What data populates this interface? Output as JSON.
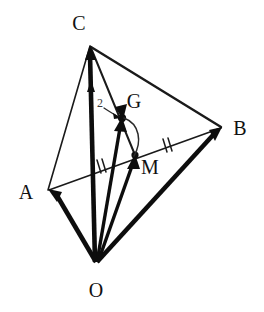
{
  "figure": {
    "background_color": "#ffffff",
    "ink_color": "#0d0d0d",
    "width": 264,
    "height": 312
  },
  "labels": {
    "vertex_a": "A",
    "vertex_b": "B",
    "vertex_c": "C",
    "vertex_o": "O",
    "point_g": "G",
    "point_m": "M",
    "ratio_two": "2"
  },
  "points": {
    "A": {
      "name": "A",
      "x": 48,
      "y": 190,
      "label_x": 26,
      "label_y": 199
    },
    "B": {
      "name": "B",
      "x": 222,
      "y": 128,
      "label_x": 236,
      "label_y": 135
    },
    "C": {
      "name": "C",
      "x": 90,
      "y": 45,
      "label_x": 79,
      "label_y": 29
    },
    "O": {
      "name": "O",
      "x": 96,
      "y": 264,
      "label_x": 88,
      "label_y": 297
    },
    "G": {
      "name": "G",
      "x": 122,
      "y": 118,
      "label_x": 127,
      "label_y": 107
    },
    "M": {
      "name": "M",
      "x": 135,
      "y": 155,
      "label_x": 142,
      "label_y": 173
    }
  },
  "edges": [
    {
      "name": "edge-a-c",
      "from": "A",
      "to": "C",
      "style": "thin"
    },
    {
      "name": "edge-c-b",
      "from": "C",
      "to": "B",
      "style": "med"
    },
    {
      "name": "edge-a-b",
      "from": "A",
      "to": "B",
      "style": "thin"
    },
    {
      "name": "cevian-c-m",
      "from": "C",
      "to": "M",
      "style": "cevian"
    }
  ],
  "vectors": [
    {
      "name": "vector-o-a",
      "from": "O",
      "to": "A",
      "weight": "thick",
      "arrow": true
    },
    {
      "name": "vector-o-b",
      "from": "O",
      "to": "B",
      "weight": "thick",
      "arrow": true
    },
    {
      "name": "vector-o-c",
      "from": "O",
      "to": "C",
      "weight": "thick",
      "arrow": true
    },
    {
      "name": "vector-o-g",
      "from": "O",
      "to": "G",
      "weight": "mid",
      "arrow": true
    },
    {
      "name": "vector-o-m",
      "from": "O",
      "to": "M",
      "weight": "mid",
      "arrow": true
    },
    {
      "name": "vector-c-g-segment",
      "from": "C",
      "to": "G",
      "weight": "mid",
      "arrow": true
    }
  ],
  "annotations": {
    "tick_am": {
      "name": "tick-mark-am",
      "x": 100,
      "y": 166,
      "count": 2,
      "segment": "AM"
    },
    "tick_mb": {
      "name": "tick-mark-mb",
      "x": 166,
      "y": 145,
      "count": 2,
      "segment": "MB"
    },
    "brace_gm": {
      "name": "brace-g-to-m",
      "from": "G",
      "to": "M",
      "bow": 14
    },
    "leader_two": {
      "name": "leader-ratio-two",
      "x1": 106,
      "y1": 110,
      "x2": 120,
      "y2": 117
    },
    "ratio_note": "2"
  }
}
